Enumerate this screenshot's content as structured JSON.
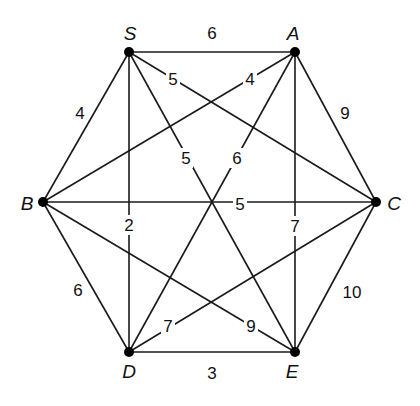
{
  "colors": {
    "line": "#1a1a1a",
    "node": "#000000",
    "text": "#111111",
    "background": "#ffffff"
  },
  "nodes": [
    {
      "id": "S",
      "label": "S",
      "x": 129,
      "y": 52,
      "lx": 130,
      "ly": 33
    },
    {
      "id": "A",
      "label": "A",
      "x": 295,
      "y": 52,
      "lx": 293,
      "ly": 33
    },
    {
      "id": "B",
      "label": "B",
      "x": 43,
      "y": 202,
      "lx": 27,
      "ly": 203
    },
    {
      "id": "C",
      "label": "C",
      "x": 376,
      "y": 202,
      "lx": 394,
      "ly": 203
    },
    {
      "id": "D",
      "label": "D",
      "x": 129,
      "y": 352,
      "lx": 129,
      "ly": 371
    },
    {
      "id": "E",
      "label": "E",
      "x": 295,
      "y": 352,
      "lx": 292,
      "ly": 371
    }
  ],
  "edges": [
    {
      "from": "S",
      "to": "A",
      "weight": "6",
      "wx": 212,
      "wy": 33,
      "bg": false
    },
    {
      "from": "S",
      "to": "B",
      "weight": "4",
      "wx": 80,
      "wy": 113,
      "bg": false
    },
    {
      "from": "S",
      "to": "C",
      "weight": "5",
      "wx": 173,
      "wy": 79,
      "bg": true
    },
    {
      "from": "S",
      "to": "D",
      "weight": "2",
      "wx": 129,
      "wy": 225,
      "bg": true
    },
    {
      "from": "S",
      "to": "E",
      "weight": "5",
      "wx": 186,
      "wy": 158,
      "bg": true
    },
    {
      "from": "A",
      "to": "B",
      "weight": "4",
      "wx": 250,
      "wy": 79,
      "bg": true
    },
    {
      "from": "A",
      "to": "C",
      "weight": "9",
      "wx": 345,
      "wy": 113,
      "bg": false
    },
    {
      "from": "A",
      "to": "D",
      "weight": "6",
      "wx": 237,
      "wy": 158,
      "bg": true
    },
    {
      "from": "A",
      "to": "E",
      "weight": "7",
      "wx": 295,
      "wy": 226,
      "bg": true
    },
    {
      "from": "B",
      "to": "C",
      "weight": "5",
      "wx": 240,
      "wy": 204,
      "bg": true
    },
    {
      "from": "B",
      "to": "D",
      "weight": "6",
      "wx": 78,
      "wy": 290,
      "bg": false
    },
    {
      "from": "B",
      "to": "E",
      "weight": "9",
      "wx": 251,
      "wy": 326,
      "bg": true
    },
    {
      "from": "C",
      "to": "D",
      "weight": "7",
      "wx": 168,
      "wy": 326,
      "bg": true
    },
    {
      "from": "C",
      "to": "E",
      "weight": "10",
      "wx": 352,
      "wy": 292,
      "bg": false
    },
    {
      "from": "D",
      "to": "E",
      "weight": "3",
      "wx": 212,
      "wy": 373,
      "bg": false
    }
  ]
}
